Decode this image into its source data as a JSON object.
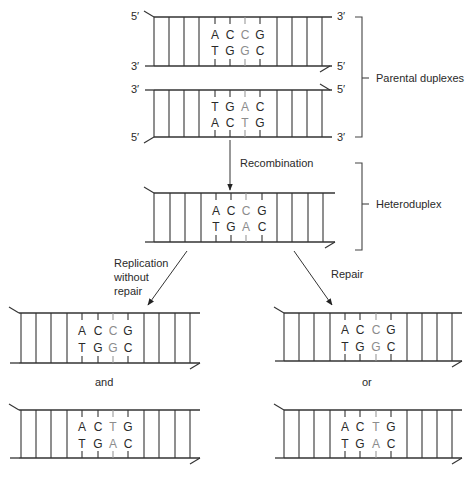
{
  "figure": {
    "colors": {
      "ink": "#333333",
      "mismatch": "#8c8c8c",
      "background": "#ffffff"
    },
    "duplexes": [
      {
        "id": "parental-1",
        "x0": 145,
        "x1": 332,
        "top_y": 17,
        "bottom_y": 66,
        "rungs_left": [
          154,
          169,
          184,
          199
        ],
        "bp_x": [
          215,
          230,
          245,
          260
        ],
        "rungs_right": [
          277,
          292,
          307,
          322
        ],
        "top_bases": [
          "A",
          "C",
          "C",
          "G"
        ],
        "bottom_bases": [
          "T",
          "G",
          "G",
          "C"
        ],
        "light_index": 2,
        "tail": "top-left",
        "end_labels": {
          "top_left": "5′",
          "bottom_left": "3′",
          "top_right": "3′",
          "bottom_right": "5′"
        }
      },
      {
        "id": "parental-2",
        "x0": 145,
        "x1": 332,
        "top_y": 90,
        "bottom_y": 137,
        "rungs_left": [
          154,
          169,
          184,
          199
        ],
        "bp_x": [
          215,
          230,
          245,
          260
        ],
        "rungs_right": [
          277,
          292,
          307,
          322
        ],
        "top_bases": [
          "T",
          "G",
          "A",
          "C"
        ],
        "bottom_bases": [
          "A",
          "C",
          "T",
          "G"
        ],
        "light_index": 2,
        "tail": "bottom-left",
        "end_labels": {
          "top_left": "3′",
          "bottom_left": "5′",
          "top_right": "5′",
          "bottom_right": "3′"
        }
      },
      {
        "id": "heteroduplex",
        "x0": 145,
        "x1": 335,
        "top_y": 193,
        "bottom_y": 242,
        "rungs_left": [
          154,
          170,
          185,
          201
        ],
        "bp_x": [
          216,
          231,
          246,
          262
        ],
        "rungs_right": [
          277,
          292,
          308,
          323
        ],
        "top_bases": [
          "A",
          "C",
          "C",
          "G"
        ],
        "bottom_bases": [
          "T",
          "G",
          "A",
          "C"
        ],
        "light_index": 2,
        "tail": "both"
      },
      {
        "id": "replication-product-1",
        "x0": 10,
        "x1": 200,
        "top_y": 313,
        "bottom_y": 363,
        "rungs_left": [
          21,
          36,
          51,
          67
        ],
        "bp_x": [
          82,
          98,
          113,
          128
        ],
        "rungs_right": [
          144,
          159,
          175,
          190
        ],
        "top_bases": [
          "A",
          "C",
          "C",
          "G"
        ],
        "bottom_bases": [
          "T",
          "G",
          "G",
          "C"
        ],
        "light_index": 2,
        "tail": "both"
      },
      {
        "id": "replication-product-2",
        "x0": 10,
        "x1": 200,
        "top_y": 410,
        "bottom_y": 458,
        "rungs_left": [
          21,
          36,
          51,
          67
        ],
        "bp_x": [
          82,
          98,
          113,
          128
        ],
        "rungs_right": [
          144,
          159,
          175,
          190
        ],
        "top_bases": [
          "A",
          "C",
          "T",
          "G"
        ],
        "bottom_bases": [
          "T",
          "G",
          "A",
          "C"
        ],
        "light_index": 2,
        "tail": "both"
      },
      {
        "id": "repair-product-1",
        "x0": 275,
        "x1": 462,
        "top_y": 313,
        "bottom_y": 361,
        "rungs_left": [
          284,
          299,
          314,
          330
        ],
        "bp_x": [
          345,
          360,
          376,
          391
        ],
        "rungs_right": [
          407,
          422,
          437,
          452
        ],
        "top_bases": [
          "A",
          "C",
          "C",
          "G"
        ],
        "bottom_bases": [
          "T",
          "G",
          "G",
          "C"
        ],
        "light_index": 2,
        "tail": "both"
      },
      {
        "id": "repair-product-2",
        "x0": 275,
        "x1": 462,
        "top_y": 410,
        "bottom_y": 458,
        "rungs_left": [
          284,
          299,
          314,
          330
        ],
        "bp_x": [
          345,
          360,
          376,
          391
        ],
        "rungs_right": [
          407,
          422,
          437,
          452
        ],
        "top_bases": [
          "A",
          "C",
          "T",
          "G"
        ],
        "bottom_bases": [
          "T",
          "G",
          "A",
          "C"
        ],
        "light_index": 2,
        "tail": "both"
      }
    ],
    "brackets": [
      {
        "id": "parental-bracket",
        "x": 362,
        "y0": 17,
        "y1": 137,
        "mid": 78,
        "label": "Parental duplexes"
      },
      {
        "id": "heteroduplex-bracket",
        "x": 362,
        "y0": 163,
        "y1": 250,
        "mid": 204,
        "label": "Heteroduplex"
      }
    ],
    "arrows": [
      {
        "id": "recombination-arrow",
        "x1": 230,
        "y1": 140,
        "x2": 230,
        "y2": 190
      },
      {
        "id": "replication-arrow",
        "x1": 187,
        "y1": 251,
        "x2": 148,
        "y2": 305
      },
      {
        "id": "repair-arrow",
        "x1": 294,
        "y1": 251,
        "x2": 332,
        "y2": 305
      }
    ],
    "labels": {
      "recombination": "Recombination",
      "replication_line1": "Replication",
      "replication_line2": "without",
      "replication_line3": "repair",
      "repair": "Repair",
      "and": "and",
      "or": "or",
      "parental_duplexes": "Parental duplexes",
      "heteroduplex": "Heteroduplex"
    }
  }
}
